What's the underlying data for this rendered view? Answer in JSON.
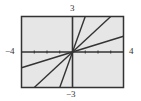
{
  "chart_data": {
    "type": "line",
    "title": "",
    "xlabel": "",
    "ylabel": "",
    "xlim": [
      -4,
      4
    ],
    "ylim": [
      -3,
      3
    ],
    "window_labels": {
      "xmin": "−4",
      "xmax": "4",
      "ymin": "−3",
      "ymax": "3"
    },
    "x_ticks": [
      -3,
      -2,
      -1,
      1,
      2,
      3
    ],
    "grid": false,
    "series": [
      {
        "name": "y = 3x",
        "slope": 3,
        "x": [
          -1,
          1
        ],
        "y": [
          -3,
          3
        ]
      },
      {
        "name": "y = x",
        "slope": 1,
        "x": [
          -3,
          3
        ],
        "y": [
          -3,
          3
        ]
      },
      {
        "name": "y = x/3",
        "slope": 0.3333,
        "x": [
          -4,
          4
        ],
        "y": [
          -1.333,
          1.333
        ]
      }
    ],
    "colors": {
      "background": "#e6e6e6",
      "frame": "#333333",
      "line": "#333333"
    }
  }
}
